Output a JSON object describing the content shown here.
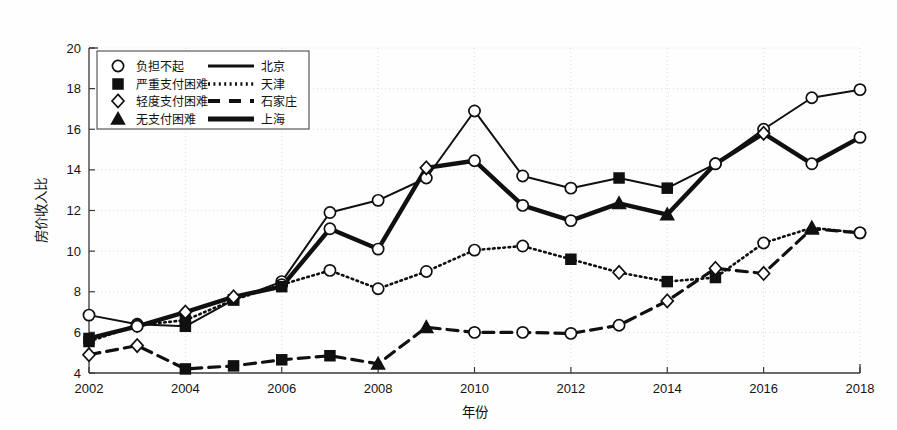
{
  "chart_data": {
    "type": "line",
    "title": "",
    "xlabel": "年份",
    "ylabel": "房价收入比",
    "xlim": [
      2002,
      2018
    ],
    "ylim": [
      4,
      20
    ],
    "ytick_step": 2,
    "xtick_step": 2,
    "grid": true,
    "legend_position": "top-left",
    "x": [
      2002,
      2003,
      2004,
      2005,
      2006,
      2007,
      2008,
      2009,
      2010,
      2011,
      2012,
      2013,
      2014,
      2015,
      2016,
      2017,
      2018
    ],
    "xticklabels": [
      "2002",
      "2004",
      "2006",
      "2008",
      "2010",
      "2012",
      "2014",
      "2016",
      "2018"
    ],
    "yticklabels": [
      "4",
      "6",
      "8",
      "10",
      "12",
      "14",
      "16",
      "18",
      "20"
    ],
    "series": [
      {
        "name": "北京",
        "line_style": "solid",
        "legend_label": "北京",
        "values": [
          6.85,
          6.4,
          6.3,
          7.6,
          8.5,
          11.9,
          12.5,
          13.6,
          16.9,
          13.7,
          13.1,
          13.6,
          13.1,
          14.3,
          16.0,
          17.55,
          17.95
        ]
      },
      {
        "name": "天津",
        "line_style": "dotted",
        "legend_label": "天津",
        "values": [
          5.55,
          6.35,
          6.6,
          7.6,
          8.35,
          9.05,
          8.15,
          9.0,
          10.05,
          10.25,
          9.6,
          8.95,
          8.5,
          8.7,
          10.4,
          11.15,
          10.9
        ]
      },
      {
        "name": "石家庄",
        "line_style": "dashed",
        "legend_label": "石家庄",
        "values": [
          4.9,
          5.35,
          4.2,
          4.35,
          4.65,
          4.85,
          4.45,
          6.25,
          6.0,
          6.0,
          5.95,
          6.35,
          7.55,
          9.15,
          8.9,
          11.1,
          10.9
        ]
      },
      {
        "name": "上海",
        "line_style": "thick-solid",
        "legend_label": "上海",
        "values": [
          5.7,
          6.3,
          7.0,
          7.75,
          8.25,
          11.1,
          10.1,
          14.1,
          14.45,
          12.25,
          11.5,
          12.35,
          11.8,
          14.3,
          15.8,
          14.3,
          15.6
        ]
      }
    ],
    "marker_legend": [
      {
        "marker": "circle-open",
        "label": "负担不起"
      },
      {
        "marker": "square-filled",
        "label": "严重支付困难"
      },
      {
        "marker": "diamond-open",
        "label": "轻度支付困难"
      },
      {
        "marker": "triangle-filled",
        "label": "无支付困难"
      }
    ],
    "markers_by_point": {
      "北京": [
        "circle-open",
        "circle-open",
        "square-filled",
        "square-filled",
        "circle-open",
        "circle-open",
        "circle-open",
        "circle-open",
        "circle-open",
        "circle-open",
        "circle-open",
        "square-filled",
        "square-filled",
        "circle-open",
        "circle-open",
        "circle-open",
        "circle-open"
      ],
      "天津": [
        "square-filled",
        "diamond-open",
        "square-filled",
        "square-filled",
        "circle-open",
        "circle-open",
        "circle-open",
        "circle-open",
        "circle-open",
        "circle-open",
        "square-filled",
        "diamond-open",
        "square-filled",
        "square-filled",
        "circle-open",
        "triangle-filled",
        "circle-open"
      ],
      "石家庄": [
        "diamond-open",
        "diamond-open",
        "square-filled",
        "square-filled",
        "square-filled",
        "square-filled",
        "triangle-filled",
        "triangle-filled",
        "circle-open",
        "circle-open",
        "circle-open",
        "circle-open",
        "diamond-open",
        "diamond-open",
        "diamond-open",
        "triangle-filled",
        "circle-open"
      ],
      "上海": [
        "square-filled",
        "circle-open",
        "diamond-open",
        "diamond-open",
        "square-filled",
        "circle-open",
        "circle-open",
        "diamond-open",
        "circle-open",
        "circle-open",
        "circle-open",
        "triangle-filled",
        "triangle-filled",
        "circle-open",
        "diamond-open",
        "circle-open",
        "circle-open"
      ]
    },
    "colors": {
      "line": "#101010",
      "grid": "#d7d7d7",
      "axis": "#3a3a3a",
      "background": "#ffffff"
    }
  }
}
